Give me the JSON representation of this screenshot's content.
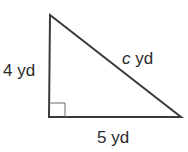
{
  "diagram": {
    "type": "right-triangle",
    "vertices": {
      "top": [
        50,
        15
      ],
      "right_angle": [
        49,
        117
      ],
      "right": [
        181,
        117
      ]
    },
    "stroke_color": "#3a3a3a",
    "labels": {
      "left_leg": {
        "value": "4",
        "unit": "yd"
      },
      "hypotenuse": {
        "value": "c",
        "unit": "yd"
      },
      "bottom_leg": {
        "value": "5",
        "unit": "yd"
      }
    },
    "right_angle_marker": true
  }
}
